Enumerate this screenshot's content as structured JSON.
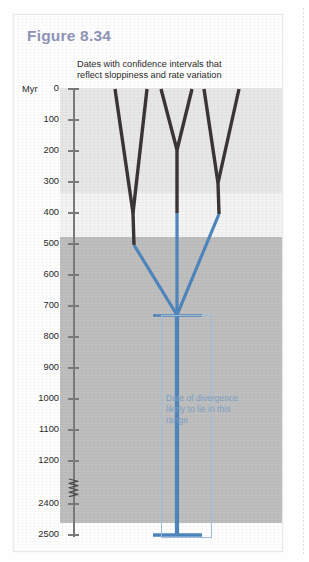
{
  "figure": {
    "title": "Figure 8.34",
    "caption_lines": [
      "Dates with confidence intervals that",
      "reflect sloppiness and rate variation"
    ],
    "annotation_lines": [
      "Date of divergence",
      "likely to lie in this",
      "range"
    ],
    "axis_unit_label": "Myr"
  },
  "colors": {
    "title": "#8e93b5",
    "branch_dark": "#3b3536",
    "branch_blue": "#4f86bd",
    "errorbar_blue": "#4f86bd",
    "annotation_text": "#7ba2c6",
    "annotation_box": "#9fc0dd",
    "axis": "#7b7b7b",
    "band_top": "#e8e8e8",
    "band_mid": "#f4f4f4",
    "band_deep": "#bfbfbf",
    "card_background": "#ffffff"
  },
  "chart_data": {
    "type": "line",
    "title": "Figure 8.34",
    "subtitle": "Dates with confidence intervals that reflect sloppiness and rate variation",
    "ylabel": "Myr",
    "xlabel": "",
    "grid": false,
    "legend": "none",
    "axis_inverted": true,
    "axis_break": {
      "between": [
        1200,
        2400
      ],
      "label": "zigzag-break"
    },
    "ytick_labels": [
      "0",
      "100",
      "200",
      "300",
      "400",
      "500",
      "600",
      "700",
      "800",
      "900",
      "1000",
      "1100",
      "1200",
      "2400",
      "2500"
    ],
    "ytick_values": [
      0,
      100,
      200,
      300,
      400,
      500,
      600,
      700,
      800,
      900,
      1000,
      1100,
      1200,
      2400,
      2500
    ],
    "ytick_pixels": [
      74,
      105,
      136,
      167,
      198,
      229,
      260,
      291,
      322,
      353,
      384,
      415,
      446,
      489,
      520
    ],
    "background_bands": [
      {
        "from_myr": 0,
        "to_myr": 340,
        "color": "#e8e8e8"
      },
      {
        "from_myr": 340,
        "to_myr": 482,
        "color": "#f4f4f4"
      },
      {
        "from_myr": 482,
        "to_myr": 2500,
        "color": "#bfbfbf"
      }
    ],
    "tree": {
      "description": "Phylogeny with six extant tips at 0 Myr; dark lineages resolve into blue (uncertain) deep branches that coalesce at a basal node near 680 Myr.",
      "tip_count": 6,
      "tips_myr": 0,
      "tips_x_px": [
        101,
        133,
        147,
        178,
        190,
        225
      ],
      "nodes": [
        {
          "name": "node-A",
          "myr": 430,
          "x_px": 119,
          "children": [
            "tip-1",
            "tip-2"
          ]
        },
        {
          "name": "node-B",
          "myr": 200,
          "x_px": 163,
          "children": [
            "tip-3",
            "tip-4"
          ]
        },
        {
          "name": "node-C",
          "myr": 400,
          "x_px": 204,
          "children": [
            "node-B-stem",
            "tip-6"
          ]
        },
        {
          "name": "root",
          "myr": 680,
          "x_px": 163,
          "children": [
            "node-A",
            "node-B",
            "node-C"
          ]
        }
      ],
      "dark_to_blue_transition_myr": 400
    },
    "error_bar": {
      "name": "divergence-confidence-interval",
      "center_myr": 680,
      "lower_myr": 680,
      "upper_myr": 2500,
      "cap_top_myr": 680,
      "cap_bottom_myr": 2500,
      "x_px": 163,
      "color": "#4f86bd",
      "annotation": "Date of divergence likely to lie in this range"
    }
  }
}
